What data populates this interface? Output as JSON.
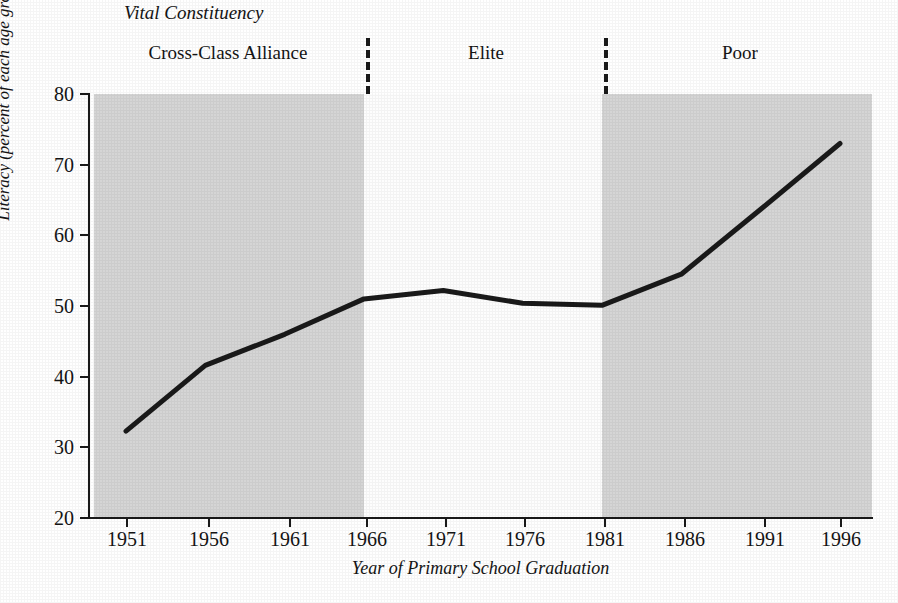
{
  "chart_data": {
    "type": "line",
    "title": "",
    "xlabel": "Year of Primary School Graduation",
    "ylabel": "Literacy (percent of each age group)",
    "xlim": [
      1949,
      1998
    ],
    "ylim": [
      20,
      80
    ],
    "grid": false,
    "legend_position": "top",
    "x": [
      1951,
      1956,
      1961,
      1966,
      1971,
      1976,
      1981,
      1986,
      1991,
      1996
    ],
    "values": [
      32.3,
      41.6,
      46.0,
      51.0,
      52.2,
      50.4,
      50.1,
      54.5,
      63.7,
      73.0
    ],
    "series": [
      {
        "name": "Literacy",
        "values": [
          32.3,
          41.6,
          46.0,
          51.0,
          52.2,
          50.4,
          50.1,
          54.5,
          63.7,
          73.0
        ]
      }
    ],
    "xticks": [
      "1951",
      "1956",
      "1961",
      "1966",
      "1971",
      "1976",
      "1981",
      "1986",
      "1991",
      "1996"
    ],
    "yticks": [
      "20",
      "30",
      "40",
      "50",
      "60",
      "70",
      "80"
    ],
    "annotations": {
      "legend_title": "Vital Constituency",
      "bands": [
        {
          "label": "Cross-Class Alliance",
          "start": 1949,
          "end": 1966,
          "shaded": true
        },
        {
          "label": "Elite",
          "start": 1966,
          "end": 1981,
          "shaded": false
        },
        {
          "label": "Poor",
          "start": 1981,
          "end": 1998,
          "shaded": true
        }
      ],
      "dividers": [
        1966,
        1981
      ]
    },
    "colors": {
      "line": "#1a1a1a",
      "shaded_band": "#d5d5d5",
      "clear_band": "#fdfdfd",
      "axis": "#1a1a1a",
      "text": "#141414"
    }
  }
}
